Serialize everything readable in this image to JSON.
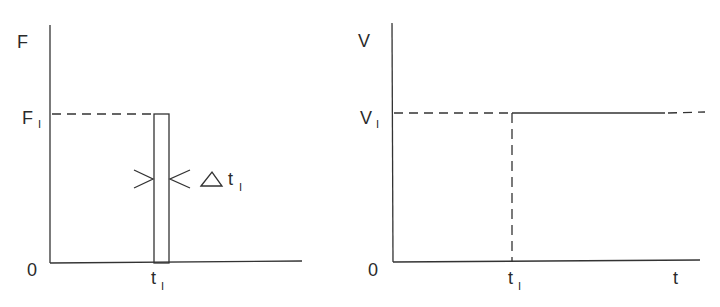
{
  "left_plot": {
    "y_axis_label": "F",
    "level_label": "F",
    "level_sub": "I",
    "origin_label": "0",
    "tick_label": "t",
    "tick_sub": "I",
    "width_label_delta": "△",
    "width_label": "t",
    "width_sub": "I"
  },
  "right_plot": {
    "y_axis_label": "V",
    "level_label": "V",
    "level_sub": "I",
    "origin_label": "0",
    "tick_label": "t",
    "tick_sub": "I",
    "x_axis_label": "t"
  },
  "colors": {
    "line": "#333333",
    "text": "#2a2a2a"
  }
}
